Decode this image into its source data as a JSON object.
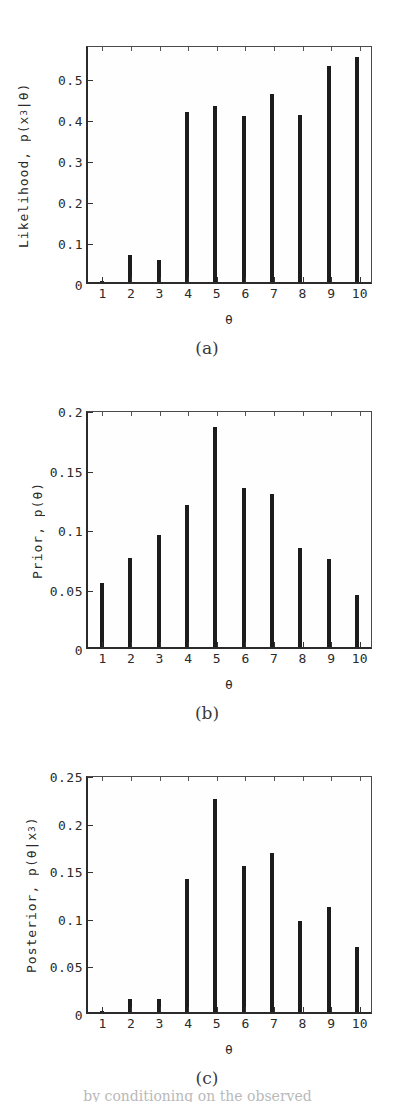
{
  "figure": {
    "background_color": "#ffffff",
    "bar_color": "#1c1c1c",
    "axis_color": "#2b2b2b",
    "bottom_partial_text": "by conditioning on the observed"
  },
  "panels": [
    {
      "caption": "(a)",
      "ylabel_prefix": "Likelihood, p(x",
      "ylabel_sub": "3",
      "ylabel_suffix": "|θ)",
      "xlabel": "θ",
      "ytick_labels": [
        "0",
        "0.1",
        "0.2",
        "0.3",
        "0.4",
        "0.5"
      ],
      "xtick_labels": [
        "1",
        "2",
        "3",
        "4",
        "5",
        "6",
        "7",
        "8",
        "9",
        "10"
      ]
    },
    {
      "caption": "(b)",
      "ylabel_prefix": "Prior, p(θ)",
      "ylabel_sub": "",
      "ylabel_suffix": "",
      "xlabel": "θ",
      "ytick_labels": [
        "0",
        "0.05",
        "0.1",
        "0.15",
        "0.2"
      ],
      "xtick_labels": [
        "1",
        "2",
        "3",
        "4",
        "5",
        "6",
        "7",
        "8",
        "9",
        "10"
      ]
    },
    {
      "caption": "(c)",
      "ylabel_prefix": "Posterior, p(θ|x",
      "ylabel_sub": "3",
      "ylabel_suffix": ")",
      "xlabel": "θ",
      "ytick_labels": [
        "0",
        "0.05",
        "0.1",
        "0.15",
        "0.2",
        "0.25"
      ],
      "xtick_labels": [
        "1",
        "2",
        "3",
        "4",
        "5",
        "6",
        "7",
        "8",
        "9",
        "10"
      ]
    }
  ],
  "chart_data": [
    {
      "type": "bar",
      "panel": "(a)",
      "title": "",
      "xlabel": "θ",
      "ylabel": "Likelihood, p(x_3|θ)",
      "categories": [
        1,
        2,
        3,
        4,
        5,
        6,
        7,
        8,
        9,
        10
      ],
      "values": [
        0.003,
        0.067,
        0.053,
        0.414,
        0.43,
        0.404,
        0.457,
        0.407,
        0.527,
        0.549
      ],
      "xlim": [
        0.5,
        10.5
      ],
      "ylim": [
        0,
        0.58
      ],
      "yticks": [
        0,
        0.1,
        0.2,
        0.3,
        0.4,
        0.5
      ],
      "grid": false,
      "legend": "none"
    },
    {
      "type": "bar",
      "panel": "(b)",
      "title": "",
      "xlabel": "θ",
      "ylabel": "Prior, p(θ)",
      "categories": [
        1,
        2,
        3,
        4,
        5,
        6,
        7,
        8,
        9,
        10
      ],
      "values": [
        0.054,
        0.075,
        0.094,
        0.119,
        0.185,
        0.134,
        0.129,
        0.083,
        0.074,
        0.044
      ],
      "xlim": [
        0.5,
        10.5
      ],
      "ylim": [
        0,
        0.2
      ],
      "yticks": [
        0,
        0.05,
        0.1,
        0.15,
        0.2
      ],
      "grid": false,
      "legend": "none"
    },
    {
      "type": "bar",
      "panel": "(c)",
      "title": "",
      "xlabel": "θ",
      "ylabel": "Posterior, p(θ|x_3)",
      "categories": [
        1,
        2,
        3,
        4,
        5,
        6,
        7,
        8,
        9,
        10
      ],
      "values": [
        0.001,
        0.014,
        0.014,
        0.14,
        0.224,
        0.153,
        0.167,
        0.096,
        0.11,
        0.068
      ],
      "xlim": [
        0.5,
        10.5
      ],
      "ylim": [
        0,
        0.25
      ],
      "yticks": [
        0,
        0.05,
        0.1,
        0.15,
        0.2,
        0.25
      ],
      "grid": false,
      "legend": "none"
    }
  ]
}
